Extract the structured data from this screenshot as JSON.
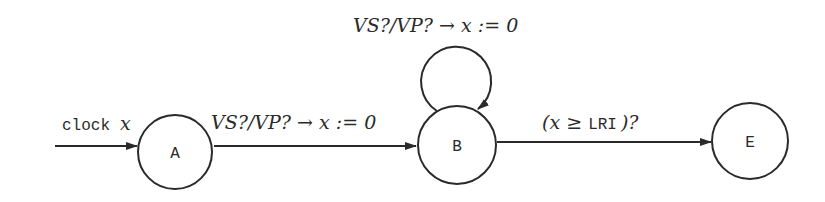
{
  "diagram": {
    "type": "timed-automaton",
    "clock_label": {
      "keyword": "clock",
      "var": "x"
    },
    "states": [
      {
        "id": "A",
        "label": "A",
        "initial": true
      },
      {
        "id": "B",
        "label": "B"
      },
      {
        "id": "E",
        "label": "E"
      }
    ],
    "transitions": [
      {
        "from": "A",
        "to": "B",
        "label": "VS?/VP? → x := 0"
      },
      {
        "from": "B",
        "to": "B",
        "label": "VS?/VP? → x := 0"
      },
      {
        "from": "B",
        "to": "E",
        "label_pre": "(x ≥ ",
        "label_const": "LRI",
        "label_post": ")?"
      }
    ],
    "colors": {
      "stroke": "#2a2a2a",
      "background": "#ffffff"
    }
  }
}
